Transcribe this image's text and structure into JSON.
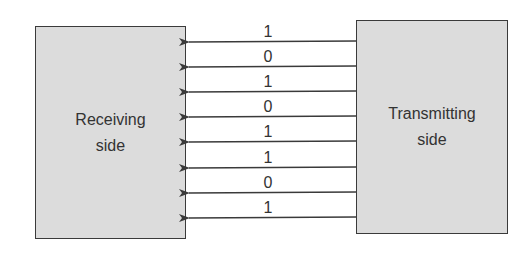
{
  "diagram": {
    "type": "parallel-transmission",
    "receiver": {
      "label_line1": "Receiving",
      "label_line2": "side"
    },
    "transmitter": {
      "label_line1": "Transmitting",
      "label_line2": "side"
    },
    "direction": "transmitter-to-receiver",
    "bits": [
      "1",
      "0",
      "1",
      "0",
      "1",
      "1",
      "0",
      "1"
    ],
    "colors": {
      "box_fill": "#dcdcdc",
      "stroke": "#3a3a3a",
      "text": "#333333"
    }
  }
}
